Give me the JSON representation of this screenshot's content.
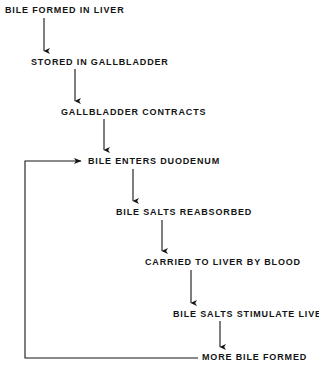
{
  "diagram": {
    "type": "flowchart",
    "orientation": "cascading-vertical-with-feedback-loop",
    "background_color": "#ffffff",
    "line_color": "#141414",
    "text_color": "#141414",
    "nodes": [
      {
        "id": "bile-formed-in-liver",
        "label": "BILE FORMED IN LIVER",
        "x": 5,
        "y": 5
      },
      {
        "id": "stored-in-gallbladder",
        "label": "STORED IN GALLBLADDER",
        "x": 31,
        "y": 57
      },
      {
        "id": "gallbladder-contracts",
        "label": "GALLBLADDER CONTRACTS",
        "x": 61,
        "y": 107
      },
      {
        "id": "bile-enters-duodenum",
        "label": "BILE ENTERS DUODENUM",
        "x": 88,
        "y": 156
      },
      {
        "id": "bile-salts-reabsorbed",
        "label": "BILE SALTS REABSORBED",
        "x": 116,
        "y": 207
      },
      {
        "id": "carried-to-liver-by-blood",
        "label": "CARRIED TO LIVER BY BLOOD",
        "x": 145,
        "y": 257
      },
      {
        "id": "bile-salts-stimulate-liver",
        "label": "BILE SALTS STIMULATE LIVER",
        "x": 173,
        "y": 309
      },
      {
        "id": "more-bile-formed",
        "label": "MORE BILE FORMED",
        "x": 202,
        "y": 352
      }
    ],
    "edges": [
      {
        "id": "edge-1",
        "from": "bile-formed-in-liver",
        "to": "stored-in-gallbladder",
        "kind": "vertical-arrow"
      },
      {
        "id": "edge-2",
        "from": "stored-in-gallbladder",
        "to": "gallbladder-contracts",
        "kind": "vertical-arrow"
      },
      {
        "id": "edge-3",
        "from": "gallbladder-contracts",
        "to": "bile-enters-duodenum",
        "kind": "vertical-arrow"
      },
      {
        "id": "edge-4",
        "from": "bile-enters-duodenum",
        "to": "bile-salts-reabsorbed",
        "kind": "vertical-arrow"
      },
      {
        "id": "edge-5",
        "from": "bile-salts-reabsorbed",
        "to": "carried-to-liver-by-blood",
        "kind": "vertical-arrow"
      },
      {
        "id": "edge-6",
        "from": "carried-to-liver-by-blood",
        "to": "bile-salts-stimulate-liver",
        "kind": "vertical-arrow"
      },
      {
        "id": "edge-7",
        "from": "bile-salts-stimulate-liver",
        "to": "more-bile-formed",
        "kind": "vertical-arrow"
      },
      {
        "id": "edge-8",
        "from": "more-bile-formed",
        "to": "bile-enters-duodenum",
        "kind": "feedback-loop-arrow"
      }
    ]
  }
}
